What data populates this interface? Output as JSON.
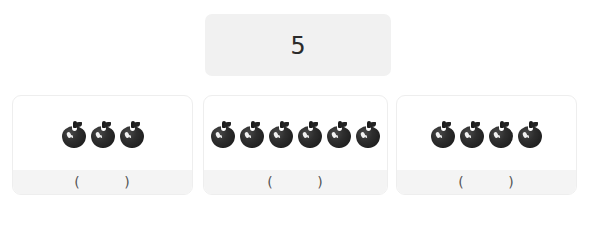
{
  "worksheet": {
    "number_card": {
      "value": "5"
    },
    "groups": [
      {
        "id": "group-1",
        "fruit": "apple-icon",
        "count": 3,
        "answer_blank": "(        )"
      },
      {
        "id": "group-2",
        "fruit": "apple-icon",
        "count": 6,
        "answer_blank": "(        )"
      },
      {
        "id": "group-3",
        "fruit": "apple-icon",
        "count": 4,
        "answer_blank": "(        )"
      }
    ]
  },
  "colors": {
    "page_background": "#ffffff",
    "number_card_background": "#f1f1f1",
    "card_background": "#ffffff",
    "card_border": "#eeeeee",
    "answer_strip_background": "#f4f4f4",
    "fruit_color": "#1b1b1b",
    "text_color": "#2b2b2b"
  }
}
